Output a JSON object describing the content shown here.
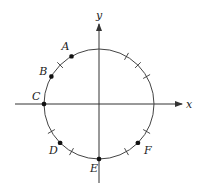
{
  "diagram": {
    "type": "unit-circle",
    "colors": {
      "line": "#333333",
      "point": "#111111",
      "background": "#ffffff"
    },
    "axes": {
      "x_label": "x",
      "y_label": "y"
    },
    "points": [
      {
        "label": "A",
        "angle_deg": 120
      },
      {
        "label": "B",
        "angle_deg": 150
      },
      {
        "label": "C",
        "angle_deg": 180
      },
      {
        "label": "D",
        "angle_deg": 225
      },
      {
        "label": "E",
        "angle_deg": 270
      },
      {
        "label": "F",
        "angle_deg": 315
      }
    ],
    "tick_angles_deg": [
      30,
      45,
      60,
      135,
      210,
      240,
      300,
      330
    ]
  }
}
